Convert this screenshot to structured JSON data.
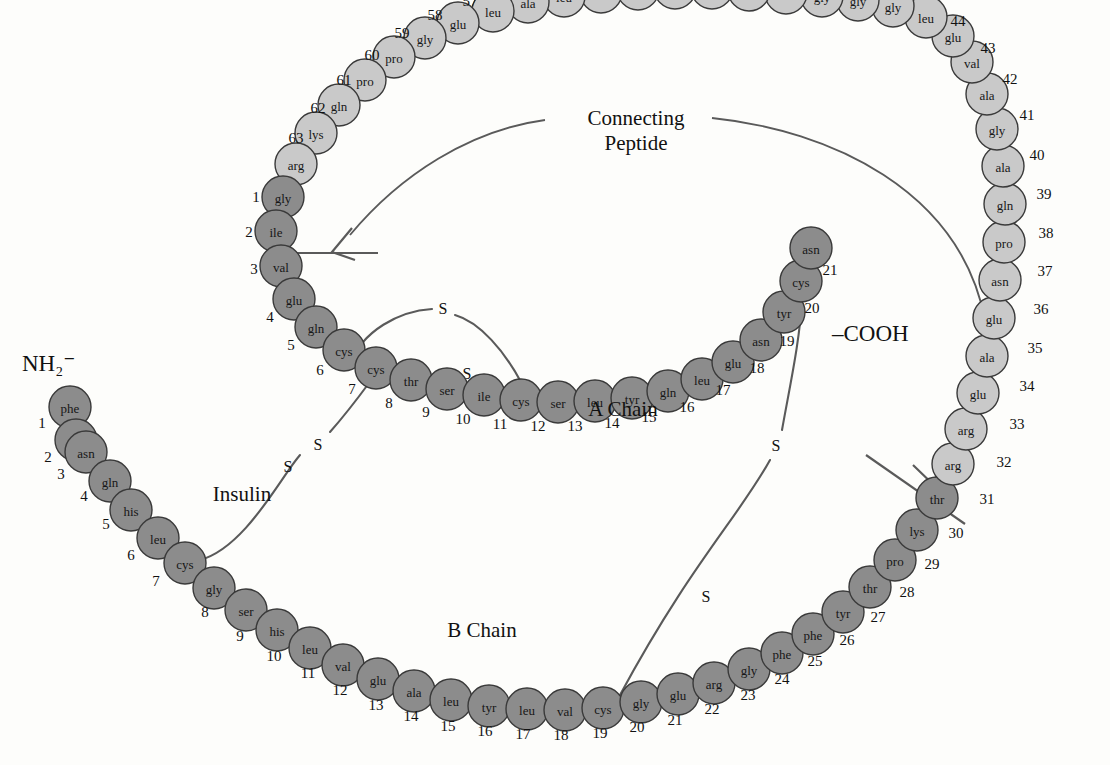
{
  "figure": {
    "title_labels": {
      "insulin": "Insulin",
      "a_chain": "A Chain",
      "b_chain": "B Chain",
      "connecting_peptide_line1": "Connecting",
      "connecting_peptide_line2": "Peptide"
    },
    "termini": {
      "n_terminus": "NH₂⁻",
      "c_terminus": "–COOH"
    },
    "disulfide_symbol": "S",
    "colors": {
      "insulin_chain_fill": "#8c8c8c",
      "c_peptide_fill": "#c9c9c9",
      "circle_stroke": "#3a3a3a",
      "line": "#5a5a5a",
      "background": "#fdfdfb",
      "text": "#171717"
    },
    "chain_segments": [
      {
        "name": "B Chain",
        "fill_key": "insulin_chain_fill",
        "start": 1,
        "end": 30
      },
      {
        "name": "Connecting Peptide",
        "fill_key": "c_peptide_fill",
        "start": 31,
        "end": 63
      },
      {
        "name": "A Chain",
        "fill_key": "insulin_chain_fill",
        "start": 1,
        "end": 21
      }
    ],
    "b_chain_residues": [
      {
        "n": 1,
        "aa": "phe",
        "cx": 70,
        "cy": 407,
        "nx": 42,
        "ny": 423
      },
      {
        "n": 2,
        "aa": "val",
        "cx": 76,
        "cy": 440,
        "nx": 48,
        "ny": 457
      },
      {
        "n": 3,
        "aa": "asn",
        "cx": 86,
        "cy": 452,
        "nx": 61,
        "ny": 474
      },
      {
        "n": 4,
        "aa": "gln",
        "cx": 110,
        "cy": 481,
        "nx": 84,
        "ny": 496
      },
      {
        "n": 5,
        "aa": "his",
        "cx": 131,
        "cy": 510,
        "nx": 106,
        "ny": 524
      },
      {
        "n": 6,
        "aa": "leu",
        "cx": 158,
        "cy": 538,
        "nx": 131,
        "ny": 555
      },
      {
        "n": 7,
        "aa": "cys",
        "cx": 185,
        "cy": 563,
        "nx": 156,
        "ny": 581
      },
      {
        "n": 8,
        "aa": "gly",
        "cx": 214,
        "cy": 588,
        "nx": 205,
        "ny": 612
      },
      {
        "n": 9,
        "aa": "ser",
        "cx": 246,
        "cy": 610,
        "nx": 240,
        "ny": 636
      },
      {
        "n": 10,
        "aa": "his",
        "cx": 277,
        "cy": 630,
        "nx": 274,
        "ny": 656
      },
      {
        "n": 11,
        "aa": "leu",
        "cx": 310,
        "cy": 648,
        "nx": 308,
        "ny": 673
      },
      {
        "n": 12,
        "aa": "val",
        "cx": 343,
        "cy": 665,
        "nx": 340,
        "ny": 690
      },
      {
        "n": 13,
        "aa": "glu",
        "cx": 378,
        "cy": 679,
        "nx": 376,
        "ny": 705
      },
      {
        "n": 14,
        "aa": "ala",
        "cx": 414,
        "cy": 691,
        "nx": 411,
        "ny": 716
      },
      {
        "n": 15,
        "aa": "leu",
        "cx": 451,
        "cy": 700,
        "nx": 448,
        "ny": 726
      },
      {
        "n": 16,
        "aa": "tyr",
        "cx": 489,
        "cy": 706,
        "nx": 485,
        "ny": 731
      },
      {
        "n": 17,
        "aa": "leu",
        "cx": 527,
        "cy": 709,
        "nx": 523,
        "ny": 734
      },
      {
        "n": 18,
        "aa": "val",
        "cx": 565,
        "cy": 710,
        "nx": 561,
        "ny": 735
      },
      {
        "n": 19,
        "aa": "cys",
        "cx": 603,
        "cy": 708,
        "nx": 600,
        "ny": 733
      },
      {
        "n": 20,
        "aa": "gly",
        "cx": 641,
        "cy": 702,
        "nx": 637,
        "ny": 727
      },
      {
        "n": 21,
        "aa": "glu",
        "cx": 678,
        "cy": 694,
        "nx": 675,
        "ny": 720
      },
      {
        "n": 22,
        "aa": "arg",
        "cx": 714,
        "cy": 683,
        "nx": 712,
        "ny": 709
      },
      {
        "n": 23,
        "aa": "gly",
        "cx": 749,
        "cy": 669,
        "nx": 748,
        "ny": 695
      },
      {
        "n": 24,
        "aa": "phe",
        "cx": 782,
        "cy": 653,
        "nx": 782,
        "ny": 679
      },
      {
        "n": 25,
        "aa": "phe",
        "cx": 813,
        "cy": 634,
        "nx": 815,
        "ny": 661
      },
      {
        "n": 26,
        "aa": "tyr",
        "cx": 843,
        "cy": 612,
        "nx": 847,
        "ny": 640
      },
      {
        "n": 27,
        "aa": "thr",
        "cx": 870,
        "cy": 587,
        "nx": 878,
        "ny": 617
      },
      {
        "n": 28,
        "aa": "pro",
        "cx": 895,
        "cy": 560,
        "nx": 907,
        "ny": 592
      },
      {
        "n": 29,
        "aa": "lys",
        "cx": 917,
        "cy": 530,
        "nx": 932,
        "ny": 564
      },
      {
        "n": 30,
        "aa": "thr",
        "cx": 937,
        "cy": 498,
        "nx": 956,
        "ny": 533
      }
    ],
    "c_peptide_residues": [
      {
        "n": 31,
        "aa": "arg",
        "cx": 953,
        "cy": 464,
        "nx": 987,
        "ny": 499
      },
      {
        "n": 32,
        "aa": "arg",
        "cx": 966,
        "cy": 429,
        "nx": 1004,
        "ny": 462
      },
      {
        "n": 33,
        "aa": "glu",
        "cx": 978,
        "cy": 393,
        "nx": 1017,
        "ny": 424
      },
      {
        "n": 34,
        "aa": "ala",
        "cx": 987,
        "cy": 356,
        "nx": 1027,
        "ny": 386
      },
      {
        "n": 35,
        "aa": "glu",
        "cx": 994,
        "cy": 318,
        "nx": 1035,
        "ny": 348
      },
      {
        "n": 36,
        "aa": "asn",
        "cx": 1000,
        "cy": 280,
        "nx": 1041,
        "ny": 309
      },
      {
        "n": 37,
        "aa": "pro",
        "cx": 1004,
        "cy": 242,
        "nx": 1045,
        "ny": 271
      },
      {
        "n": 38,
        "aa": "gln",
        "cx": 1005,
        "cy": 204,
        "nx": 1046,
        "ny": 233
      },
      {
        "n": 39,
        "aa": "ala",
        "cx": 1003,
        "cy": 166,
        "nx": 1044,
        "ny": 194
      },
      {
        "n": 40,
        "aa": "gly",
        "cx": 997,
        "cy": 129,
        "nx": 1037,
        "ny": 155
      },
      {
        "n": 41,
        "aa": "ala",
        "cx": 987,
        "cy": 94,
        "nx": 1027,
        "ny": 115
      },
      {
        "n": 42,
        "aa": "val",
        "cx": 972,
        "cy": 62,
        "nx": 1010,
        "ny": 79
      },
      {
        "n": 43,
        "aa": "glu",
        "cx": 953,
        "cy": 36,
        "nx": 988,
        "ny": 48
      },
      {
        "n": 44,
        "aa": "leu",
        "cx": 926,
        "cy": 17,
        "nx": 958,
        "ny": 21
      },
      {
        "n": 45,
        "aa": "gly",
        "cx": 893,
        "cy": 6,
        "nx": 921,
        "ny": -8
      },
      {
        "n": 46,
        "aa": "gly",
        "cx": 858,
        "cy": 0,
        "nx": 880,
        "ny": -16
      },
      {
        "n": 47,
        "aa": "gly",
        "cx": 822,
        "cy": -4,
        "nx": 841,
        "ny": -22
      },
      {
        "n": 48,
        "aa": "leu",
        "cx": 786,
        "cy": -7,
        "nx": 804,
        "ny": -26
      },
      {
        "n": 49,
        "aa": "gly",
        "cx": 749,
        "cy": -10,
        "nx": 766,
        "ny": -29
      },
      {
        "n": 50,
        "aa": "gly",
        "cx": 712,
        "cy": -12,
        "nx": 729,
        "ny": -31
      },
      {
        "n": 51,
        "aa": "leu",
        "cx": 675,
        "cy": -12,
        "nx": 692,
        "ny": -32
      },
      {
        "n": 52,
        "aa": "gln",
        "cx": 638,
        "cy": -11,
        "nx": 655,
        "ny": -31
      },
      {
        "n": 53,
        "aa": "ala",
        "cx": 601,
        "cy": -8,
        "nx": 618,
        "ny": -28
      },
      {
        "n": 54,
        "aa": "leu",
        "cx": 564,
        "cy": -4,
        "nx": 580,
        "ny": -24
      },
      {
        "n": 55,
        "aa": "ala",
        "cx": 528,
        "cy": 2,
        "nx": 543,
        "ny": -18
      },
      {
        "n": 56,
        "aa": "leu",
        "cx": 493,
        "cy": 11,
        "nx": 506,
        "ny": -10
      },
      {
        "n": 57,
        "aa": "glu",
        "cx": 458,
        "cy": 23,
        "nx": 470,
        "ny": 1
      },
      {
        "n": 58,
        "aa": "gly",
        "cx": 425,
        "cy": 38,
        "nx": 435,
        "ny": 15
      },
      {
        "n": 59,
        "aa": "pro",
        "cx": 394,
        "cy": 57,
        "nx": 402,
        "ny": 33
      },
      {
        "n": 60,
        "aa": "pro",
        "cx": 365,
        "cy": 80,
        "nx": 372,
        "ny": 55
      },
      {
        "n": 61,
        "aa": "gln",
        "cx": 339,
        "cy": 105,
        "nx": 344,
        "ny": 80
      },
      {
        "n": 62,
        "aa": "lys",
        "cx": 316,
        "cy": 133,
        "nx": 318,
        "ny": 108
      },
      {
        "n": 63,
        "aa": "arg",
        "cx": 296,
        "cy": 164,
        "nx": 296,
        "ny": 138
      }
    ],
    "a_chain_residues": [
      {
        "n": 1,
        "aa": "gly",
        "cx": 283,
        "cy": 197,
        "nx": 256,
        "ny": 197
      },
      {
        "n": 2,
        "aa": "ile",
        "cx": 276,
        "cy": 231,
        "nx": 249,
        "ny": 232
      },
      {
        "n": 3,
        "aa": "val",
        "cx": 281,
        "cy": 266,
        "nx": 254,
        "ny": 269
      },
      {
        "n": 4,
        "aa": "glu",
        "cx": 294,
        "cy": 299,
        "nx": 270,
        "ny": 317
      },
      {
        "n": 5,
        "aa": "gln",
        "cx": 316,
        "cy": 327,
        "nx": 291,
        "ny": 345
      },
      {
        "n": 6,
        "aa": "cys",
        "cx": 344,
        "cy": 350,
        "nx": 320,
        "ny": 370
      },
      {
        "n": 7,
        "aa": "cys",
        "cx": 376,
        "cy": 368,
        "nx": 352,
        "ny": 389
      },
      {
        "n": 8,
        "aa": "thr",
        "cx": 411,
        "cy": 380,
        "nx": 389,
        "ny": 403
      },
      {
        "n": 9,
        "aa": "ser",
        "cx": 447,
        "cy": 389,
        "nx": 426,
        "ny": 412
      },
      {
        "n": 10,
        "aa": "ile",
        "cx": 484,
        "cy": 395,
        "nx": 463,
        "ny": 419
      },
      {
        "n": 11,
        "aa": "cys",
        "cx": 521,
        "cy": 400,
        "nx": 500,
        "ny": 424
      },
      {
        "n": 12,
        "aa": "ser",
        "cx": 558,
        "cy": 402,
        "nx": 538,
        "ny": 426
      },
      {
        "n": 13,
        "aa": "leu",
        "cx": 595,
        "cy": 401,
        "nx": 575,
        "ny": 426
      },
      {
        "n": 14,
        "aa": "tyr",
        "cx": 632,
        "cy": 398,
        "nx": 612,
        "ny": 423
      },
      {
        "n": 15,
        "aa": "gln",
        "cx": 668,
        "cy": 391,
        "nx": 649,
        "ny": 417
      },
      {
        "n": 16,
        "aa": "leu",
        "cx": 702,
        "cy": 379,
        "nx": 687,
        "ny": 407
      },
      {
        "n": 17,
        "aa": "glu",
        "cx": 733,
        "cy": 362,
        "nx": 723,
        "ny": 390
      },
      {
        "n": 18,
        "aa": "asn",
        "cx": 761,
        "cy": 340,
        "nx": 757,
        "ny": 368
      },
      {
        "n": 19,
        "aa": "tyr",
        "cx": 784,
        "cy": 312,
        "nx": 787,
        "ny": 341
      },
      {
        "n": 20,
        "aa": "cys",
        "cx": 801,
        "cy": 281,
        "nx": 812,
        "ny": 308
      },
      {
        "n": 21,
        "aa": "asn",
        "cx": 811,
        "cy": 248,
        "nx": 830,
        "ny": 270
      }
    ],
    "disulfide_bonds": [
      {
        "id": "A6-A11",
        "s1": "S",
        "s2": "S"
      },
      {
        "id": "A7-B7",
        "s1": "S",
        "s2": "S"
      },
      {
        "id": "A20-B19",
        "s1": "S",
        "s2": "S"
      }
    ]
  }
}
